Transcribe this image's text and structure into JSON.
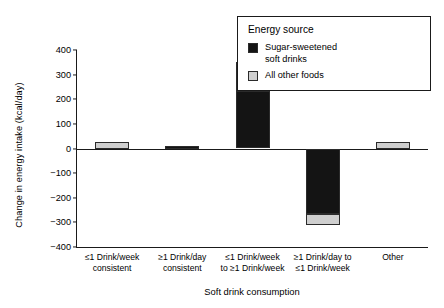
{
  "chart_data": {
    "type": "bar",
    "subtype": "stacked-bar",
    "title": "",
    "xlabel": "Soft drink consumption",
    "ylabel": "Change in energy intake (kcal/day)",
    "ylim": [
      -400,
      400
    ],
    "yticks": [
      400,
      300,
      200,
      100,
      0,
      -100,
      -200,
      -300,
      -400
    ],
    "ytick_labels": [
      "400",
      "300",
      "200",
      "100",
      "0",
      "−100",
      "−200",
      "−300",
      "−400"
    ],
    "grid": false,
    "legend_position": "top-right",
    "legend_title": "Energy source",
    "categories": [
      "≤1 Drink/week consistent",
      "≥1 Drink/day consistent",
      "≤1 Drink/week to ≥1 Drink/week",
      "≥1 Drink/day to ≤1 Drink/week",
      "Other"
    ],
    "category_lines": [
      [
        "≤1 Drink/week",
        "consistent"
      ],
      [
        "≥1 Drink/day",
        "consistent"
      ],
      [
        "≤1 Drink/week",
        "to ≥1 Drink/week"
      ],
      [
        "≥1 Drink/day to",
        "≤1 Drink/week"
      ],
      [
        "Other"
      ]
    ],
    "series": [
      {
        "name": "Sugar-sweetened soft drinks",
        "color": "#141414",
        "values": [
          0,
          10,
          235,
          -265,
          0
        ]
      },
      {
        "name": "All other foods",
        "color": "#cfcfcf",
        "values": [
          25,
          0,
          115,
          -45,
          25
        ]
      }
    ],
    "totals": [
      25,
      10,
      350,
      -310,
      25
    ]
  },
  "legend": {
    "title": "Energy source",
    "entries": [
      {
        "label_line1": "Sugar-sweetened",
        "label_line2": "soft drinks",
        "color": "#141414"
      },
      {
        "label_line1": "All other foods",
        "label_line2": "",
        "color": "#cfcfcf"
      }
    ]
  },
  "colors": {
    "soft_drinks": "#141414",
    "other_foods": "#cfcfcf",
    "axis": "#1a1a1a",
    "background": "#ffffff"
  }
}
